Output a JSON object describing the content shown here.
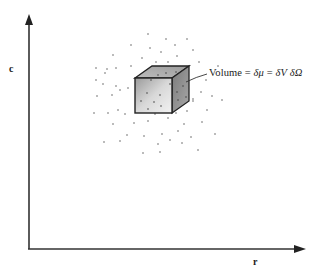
{
  "figure": {
    "type": "phase-space-volume-element",
    "axes": {
      "vertical_label": "c",
      "horizontal_label": "r"
    },
    "annotation": {
      "text": "Volume = δμ = δV δΩ",
      "prefix": "Volume",
      "eq1": "=",
      "term1": "δμ",
      "eq2": "=",
      "term2a": "δV",
      "term2b": "δΩ"
    },
    "colors": {
      "axis": "#333333",
      "dots": "#555555",
      "cube_front": "#c8c8c8",
      "cube_top": "#b0b0b0",
      "cube_side": "#8a8a8a",
      "cube_edge": "#222222"
    },
    "dots": [
      [
        148,
        34
      ],
      [
        166,
        39
      ],
      [
        187,
        39
      ],
      [
        131,
        45
      ],
      [
        175,
        45
      ],
      [
        150,
        48
      ],
      [
        193,
        50
      ],
      [
        113,
        55
      ],
      [
        161,
        52
      ],
      [
        177,
        56
      ],
      [
        142,
        58
      ],
      [
        116,
        68
      ],
      [
        107,
        69
      ],
      [
        96,
        68
      ],
      [
        168,
        62
      ],
      [
        199,
        62
      ],
      [
        96,
        80
      ],
      [
        105,
        73
      ],
      [
        147,
        73
      ],
      [
        103,
        84
      ],
      [
        116,
        86
      ],
      [
        120,
        90
      ],
      [
        128,
        88
      ],
      [
        193,
        99
      ],
      [
        206,
        80
      ],
      [
        218,
        66
      ],
      [
        94,
        113
      ],
      [
        108,
        113
      ],
      [
        125,
        114
      ],
      [
        141,
        112
      ],
      [
        155,
        114
      ],
      [
        167,
        112
      ],
      [
        176,
        113
      ],
      [
        187,
        111
      ],
      [
        193,
        101
      ],
      [
        207,
        110
      ],
      [
        113,
        124
      ],
      [
        134,
        123
      ],
      [
        148,
        121
      ],
      [
        168,
        118
      ],
      [
        184,
        124
      ],
      [
        202,
        122
      ],
      [
        215,
        134
      ],
      [
        127,
        135
      ],
      [
        144,
        136
      ],
      [
        162,
        134
      ],
      [
        178,
        131
      ],
      [
        191,
        137
      ],
      [
        104,
        142
      ],
      [
        120,
        141
      ],
      [
        158,
        144
      ],
      [
        170,
        140
      ],
      [
        182,
        143
      ],
      [
        143,
        153
      ],
      [
        160,
        152
      ],
      [
        198,
        150
      ],
      [
        112,
        95
      ],
      [
        97,
        96
      ],
      [
        118,
        110
      ],
      [
        201,
        92
      ],
      [
        212,
        96
      ],
      [
        222,
        100
      ],
      [
        131,
        66
      ],
      [
        156,
        62
      ]
    ],
    "cube_dots": [
      [
        147,
        93
      ],
      [
        154,
        102
      ],
      [
        160,
        95
      ],
      [
        141,
        101
      ],
      [
        148,
        109
      ],
      [
        161,
        106
      ],
      [
        170,
        84
      ],
      [
        177,
        92
      ],
      [
        183,
        86
      ],
      [
        178,
        100
      ],
      [
        186,
        97
      ],
      [
        158,
        75
      ],
      [
        166,
        73
      ],
      [
        176,
        72
      ],
      [
        151,
        80
      ]
    ]
  }
}
